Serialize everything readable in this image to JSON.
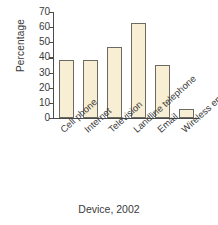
{
  "chart_data": {
    "type": "bar",
    "title": "",
    "xlabel": "Device, 2002",
    "ylabel": "Percentage",
    "categories": [
      "Cell phone",
      "Internet",
      "Television",
      "Landline telephone",
      "Email",
      "Wireless email device"
    ],
    "values": [
      38,
      38,
      47,
      63,
      35,
      6
    ],
    "ylim": [
      0,
      70
    ],
    "ytick_labels": [
      "0",
      "10",
      "20",
      "30",
      "40",
      "50",
      "60",
      "70"
    ],
    "ytick_values": [
      0,
      10,
      20,
      30,
      40,
      50,
      60,
      70
    ],
    "grid": false,
    "legend": null,
    "bar_fill_color": "#f8eed3",
    "bar_border_color": "#6b6b63",
    "axis_color": "#4a4a4a",
    "text_color": "#3a3a3a",
    "background_color": "#ffffff",
    "xlabel_rotation_deg": -42
  }
}
